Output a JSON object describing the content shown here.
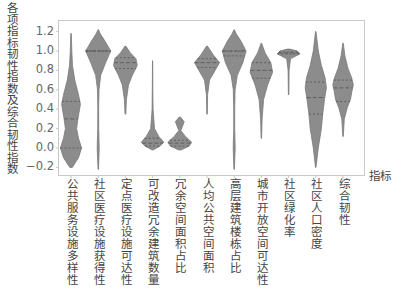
{
  "chart_data": {
    "type": "violin",
    "title": "",
    "xlabel": "指标",
    "ylabel": "各项指标韧性指数及综合韧性指数",
    "ylim": [
      -0.27,
      1.32
    ],
    "yticks": [
      -0.2,
      0.0,
      0.2,
      0.4,
      0.6,
      0.8,
      1.0,
      1.2
    ],
    "ytick_labels": [
      "−0.2",
      "0.0",
      "0.2",
      "0.4",
      "0.6",
      "0.8",
      "1.0",
      "1.2"
    ],
    "grid": false,
    "legend": null,
    "fill_color": "#8c8c8c",
    "edge_color": "#7a7a7a",
    "quartile_line_color": "#555555",
    "categories": [
      "公共服务设施多样性",
      "社区医疗设施获得性",
      "定点医疗设施可达性",
      "可改造冗余建筑数量",
      "冗余空间面积占比",
      "人均公共空间面积",
      "高层建筑楼栋占比",
      "城市开放空间可达性",
      "社区绿化率",
      "社区人口密度",
      "综合韧性"
    ],
    "violins": [
      {
        "min": -0.2,
        "max": 1.18,
        "q1": 0.0,
        "median": 0.3,
        "q3": 0.48,
        "profile": [
          [
            -0.2,
            0.1
          ],
          [
            -0.1,
            0.6
          ],
          [
            0.0,
            0.85
          ],
          [
            0.1,
            0.6
          ],
          [
            0.2,
            0.45
          ],
          [
            0.3,
            0.55
          ],
          [
            0.45,
            0.75
          ],
          [
            0.55,
            0.6
          ],
          [
            0.7,
            0.3
          ],
          [
            0.85,
            0.12
          ],
          [
            1.0,
            0.06
          ],
          [
            1.18,
            0.02
          ]
        ]
      },
      {
        "min": -0.22,
        "max": 1.22,
        "q1": 1.0,
        "median": 1.0,
        "q3": 1.0,
        "profile": [
          [
            -0.22,
            0.02
          ],
          [
            0.0,
            0.08
          ],
          [
            0.2,
            0.04
          ],
          [
            0.4,
            0.03
          ],
          [
            0.6,
            0.06
          ],
          [
            0.75,
            0.2
          ],
          [
            0.88,
            0.6
          ],
          [
            1.0,
            1.0
          ],
          [
            1.1,
            0.55
          ],
          [
            1.18,
            0.15
          ],
          [
            1.22,
            0.02
          ]
        ]
      },
      {
        "min": 0.35,
        "max": 1.05,
        "q1": 0.82,
        "median": 0.88,
        "q3": 0.93,
        "profile": [
          [
            0.35,
            0.03
          ],
          [
            0.5,
            0.08
          ],
          [
            0.65,
            0.25
          ],
          [
            0.75,
            0.55
          ],
          [
            0.85,
            0.95
          ],
          [
            0.92,
            0.85
          ],
          [
            0.98,
            0.4
          ],
          [
            1.05,
            0.03
          ]
        ]
      },
      {
        "min": -0.02,
        "max": 0.9,
        "q1": 0.02,
        "median": 0.05,
        "q3": 0.1,
        "profile": [
          [
            -0.02,
            0.05
          ],
          [
            0.02,
            0.6
          ],
          [
            0.06,
            0.9
          ],
          [
            0.12,
            0.5
          ],
          [
            0.2,
            0.15
          ],
          [
            0.4,
            0.04
          ],
          [
            0.6,
            0.02
          ],
          [
            0.9,
            0.01
          ]
        ]
      },
      {
        "min": -0.02,
        "max": 0.32,
        "q1": 0.02,
        "median": 0.05,
        "q3": 0.08,
        "profile": [
          [
            -0.02,
            0.1
          ],
          [
            0.02,
            0.75
          ],
          [
            0.06,
            0.95
          ],
          [
            0.12,
            0.45
          ],
          [
            0.18,
            0.08
          ],
          [
            0.22,
            0.2
          ],
          [
            0.27,
            0.35
          ],
          [
            0.32,
            0.05
          ]
        ]
      },
      {
        "min": 0.35,
        "max": 1.05,
        "q1": 0.83,
        "median": 0.88,
        "q3": 0.92,
        "profile": [
          [
            0.35,
            0.02
          ],
          [
            0.55,
            0.05
          ],
          [
            0.7,
            0.2
          ],
          [
            0.8,
            0.65
          ],
          [
            0.88,
            1.0
          ],
          [
            0.96,
            0.5
          ],
          [
            1.05,
            0.03
          ]
        ]
      },
      {
        "min": -0.22,
        "max": 1.22,
        "q1": 0.95,
        "median": 1.0,
        "q3": 1.0,
        "profile": [
          [
            -0.22,
            0.02
          ],
          [
            0.0,
            0.08
          ],
          [
            0.2,
            0.04
          ],
          [
            0.4,
            0.04
          ],
          [
            0.6,
            0.07
          ],
          [
            0.75,
            0.25
          ],
          [
            0.88,
            0.7
          ],
          [
            1.0,
            0.95
          ],
          [
            1.1,
            0.55
          ],
          [
            1.18,
            0.15
          ],
          [
            1.22,
            0.02
          ]
        ]
      },
      {
        "min": 0.1,
        "max": 1.08,
        "q1": 0.72,
        "median": 0.8,
        "q3": 0.88,
        "profile": [
          [
            0.1,
            0.02
          ],
          [
            0.3,
            0.06
          ],
          [
            0.5,
            0.18
          ],
          [
            0.65,
            0.5
          ],
          [
            0.78,
            0.9
          ],
          [
            0.88,
            0.75
          ],
          [
            0.98,
            0.3
          ],
          [
            1.08,
            0.02
          ]
        ]
      },
      {
        "min": 0.55,
        "max": 1.02,
        "q1": 0.97,
        "median": 0.98,
        "q3": 0.99,
        "profile": [
          [
            0.55,
            0.02
          ],
          [
            0.8,
            0.04
          ],
          [
            0.92,
            0.15
          ],
          [
            0.97,
            0.9
          ],
          [
            1.0,
            0.7
          ],
          [
            1.02,
            0.1
          ]
        ]
      },
      {
        "min": -0.2,
        "max": 1.2,
        "q1": 0.35,
        "median": 0.52,
        "q3": 0.68,
        "profile": [
          [
            -0.2,
            0.02
          ],
          [
            0.0,
            0.2
          ],
          [
            0.2,
            0.45
          ],
          [
            0.35,
            0.55
          ],
          [
            0.5,
            0.7
          ],
          [
            0.62,
            0.85
          ],
          [
            0.72,
            0.75
          ],
          [
            0.85,
            0.45
          ],
          [
            1.0,
            0.2
          ],
          [
            1.2,
            0.02
          ]
        ]
      },
      {
        "min": 0.12,
        "max": 1.08,
        "q1": 0.48,
        "median": 0.62,
        "q3": 0.7,
        "profile": [
          [
            0.12,
            0.02
          ],
          [
            0.3,
            0.1
          ],
          [
            0.42,
            0.35
          ],
          [
            0.5,
            0.6
          ],
          [
            0.58,
            0.7
          ],
          [
            0.65,
            0.82
          ],
          [
            0.72,
            0.7
          ],
          [
            0.82,
            0.4
          ],
          [
            0.95,
            0.15
          ],
          [
            1.08,
            0.02
          ]
        ]
      }
    ]
  }
}
